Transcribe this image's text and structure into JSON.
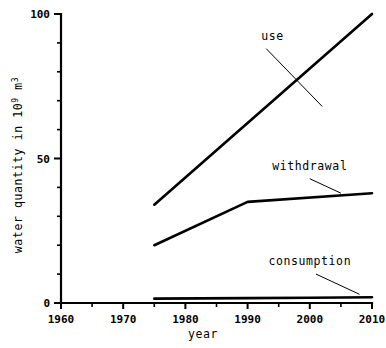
{
  "chart_data": {
    "type": "line",
    "title": "",
    "xlabel": "year",
    "ylabel": "water quantity in 10⁹ m³",
    "ylabel_parts": {
      "prefix": "water quantity in 10",
      "exponent": "9",
      "unit_base": " m",
      "unit_exponent": "3"
    },
    "xlim": [
      1960,
      2010
    ],
    "ylim": [
      0,
      100
    ],
    "x_ticks": [
      1960,
      1970,
      1980,
      1990,
      2000,
      2010
    ],
    "x_tick_labels": [
      "1960",
      "1970",
      "1980",
      "1990",
      "2000",
      "2010"
    ],
    "x_minor_step": 5,
    "y_ticks": [
      0,
      50,
      100
    ],
    "y_tick_labels": [
      "0",
      "50",
      "100"
    ],
    "y_minor_step": 10,
    "grid": false,
    "legend_position": "inline-annotations",
    "series": [
      {
        "name": "use",
        "x": [
          1975,
          2010
        ],
        "values": [
          34,
          100
        ],
        "annotation": {
          "label": "use",
          "label_x": 1994,
          "label_y": 91,
          "leader_from": [
            1993,
            88
          ],
          "leader_to": [
            2002,
            68
          ]
        }
      },
      {
        "name": "withdrawal",
        "x": [
          1975,
          1990,
          2010
        ],
        "values": [
          20,
          35,
          38
        ],
        "annotation": {
          "label": "withdrawal",
          "label_x": 2000,
          "label_y": 46,
          "leader_from": [
            2000,
            43
          ],
          "leader_to": [
            2005,
            38
          ]
        }
      },
      {
        "name": "consumption",
        "x": [
          1975,
          1990,
          2000,
          2010
        ],
        "values": [
          1.5,
          1.7,
          1.8,
          2.0
        ],
        "annotation": {
          "label": "consumption",
          "label_x": 2000,
          "label_y": 13,
          "leader_from": [
            2001,
            10
          ],
          "leader_to": [
            2008,
            3
          ]
        }
      }
    ],
    "colors": {
      "line": "#000000",
      "axis": "#000000",
      "background": "#ffffff"
    }
  }
}
